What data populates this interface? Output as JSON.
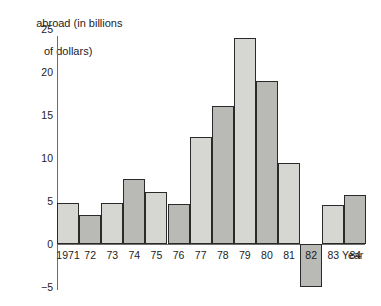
{
  "chart_data": {
    "type": "bar",
    "title": "abroad (in billions of dollars)",
    "title_line1": "abroad (in billions",
    "title_line2": "of dollars)",
    "xlabel": "Year",
    "ylabel": "",
    "categories": [
      "1971",
      "72",
      "73",
      "74",
      "75",
      "76",
      "77",
      "78",
      "79",
      "80",
      "81",
      "82",
      "83",
      "84"
    ],
    "values": [
      4.8,
      3.4,
      4.8,
      7.6,
      6.0,
      4.7,
      12.5,
      16.0,
      24.0,
      19.0,
      9.4,
      -5.0,
      4.5,
      5.7
    ],
    "ylim": [
      -5,
      25
    ],
    "yticks": [
      "25",
      "20",
      "15",
      "10",
      "5",
      "0",
      "−5"
    ],
    "ytick_values": [
      25,
      20,
      15,
      10,
      5,
      0,
      -5
    ],
    "grid": false,
    "legend": "none",
    "bar_colors": [
      "#d6d6d2",
      "#b9b9b5"
    ],
    "bar_border_color": "#2a2a2a",
    "axis_color": "#6e6e6e"
  }
}
